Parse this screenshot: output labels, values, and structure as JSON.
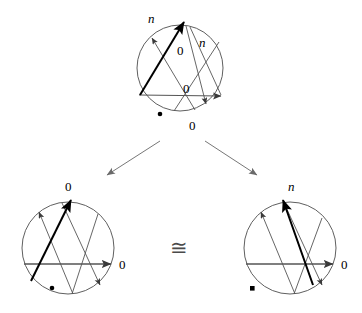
{
  "figure": {
    "name": "congruence-of-chord-diagrams",
    "relation_symbol": "≅",
    "background_color": "#ffffff",
    "stroke_color": "#000000",
    "thin_stroke_color": "#555555",
    "heavy_stroke_color": "#000000"
  },
  "diagrams": [
    {
      "id": "top",
      "name": "top-chord-diagram",
      "circle": {
        "cx": 180,
        "cy": 68,
        "r": 43
      },
      "labels": [
        {
          "id": "top-n-outer",
          "text": "n",
          "x": 148,
          "y": 12,
          "italic": true
        },
        {
          "id": "top-n-inner",
          "text": "n",
          "x": 199,
          "y": 36,
          "italic": true
        },
        {
          "id": "top-zero-upper",
          "text": "0",
          "x": 177,
          "y": 44,
          "italic": false
        },
        {
          "id": "top-zero-middle",
          "text": "0",
          "x": 183,
          "y": 82,
          "italic": false
        },
        {
          "id": "top-zero-bottom",
          "text": "0",
          "x": 189,
          "y": 119,
          "italic": false
        }
      ],
      "markers": [
        {
          "id": "top-dot",
          "shape": "dot",
          "x": 160,
          "y": 114
        }
      ]
    },
    {
      "id": "bottom-left",
      "name": "bottom-left-chord-diagram",
      "circle": {
        "cx": 68,
        "cy": 248,
        "r": 46
      },
      "labels": [
        {
          "id": "bl-zero-top",
          "text": "0",
          "x": 65,
          "y": 180,
          "italic": false
        },
        {
          "id": "bl-zero-right",
          "text": "0",
          "x": 119,
          "y": 258,
          "italic": false
        }
      ],
      "markers": [
        {
          "id": "bl-dot",
          "shape": "dot",
          "x": 52,
          "y": 288
        }
      ]
    },
    {
      "id": "bottom-right",
      "name": "bottom-right-chord-diagram",
      "circle": {
        "cx": 290,
        "cy": 248,
        "r": 46
      },
      "labels": [
        {
          "id": "br-n-top",
          "text": "n",
          "x": 288,
          "y": 180,
          "italic": true
        },
        {
          "id": "br-zero-right",
          "text": "0",
          "x": 341,
          "y": 258,
          "italic": false
        }
      ],
      "markers": [
        {
          "id": "br-square",
          "shape": "square",
          "x": 252,
          "y": 288
        }
      ]
    }
  ],
  "connectors": [
    {
      "id": "arrow-to-left",
      "name": "arrow-top-to-bottom-left",
      "x1": 160,
      "y1": 141,
      "x2": 107,
      "y2": 175
    },
    {
      "id": "arrow-to-right",
      "name": "arrow-top-to-bottom-right",
      "x1": 205,
      "y1": 141,
      "x2": 257,
      "y2": 175
    }
  ],
  "relation": {
    "id": "congruence",
    "name": "congruence-symbol",
    "text": "≅",
    "x": 170,
    "y": 238
  }
}
